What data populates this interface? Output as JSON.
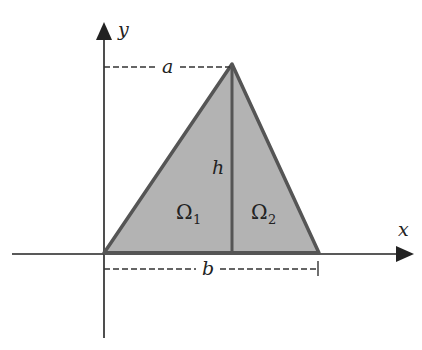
{
  "diagram": {
    "type": "triangle-domain-split",
    "axes": {
      "x_label": "x",
      "y_label": "y"
    },
    "dimension_labels": {
      "apex_offset": "a",
      "base_length": "b",
      "height": "h"
    },
    "regions": [
      {
        "symbol": "Ω",
        "subscript": "1"
      },
      {
        "symbol": "Ω",
        "subscript": "2"
      }
    ],
    "colors": {
      "fill": "#b3b3b3",
      "edge": "#555555",
      "axis": "#222222",
      "dashed": "#333333"
    }
  }
}
